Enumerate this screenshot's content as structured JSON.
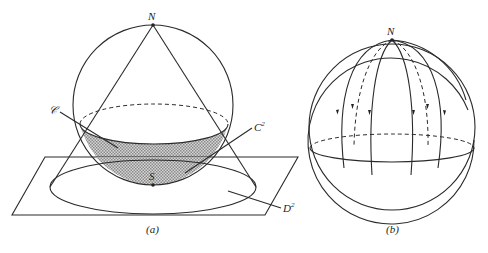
{
  "figure_a": {
    "caption": "(a)",
    "labels": {
      "north_pole": "N",
      "south_pole": "S",
      "cap_curve": "𝒞",
      "cap_surface": "C",
      "cap_surface_sup": "2",
      "disc": "D",
      "disc_sup": "2"
    },
    "description": "Sphere tangent to a plane at S, cone of lines from N projecting shaded spherical cap C² onto disc D²"
  },
  "figure_b": {
    "caption": "(b)",
    "labels": {
      "north_pole": "N"
    },
    "description": "Sphere with meridian flow lines emanating from N, arrows pointing downward; dashed lines on back side"
  }
}
